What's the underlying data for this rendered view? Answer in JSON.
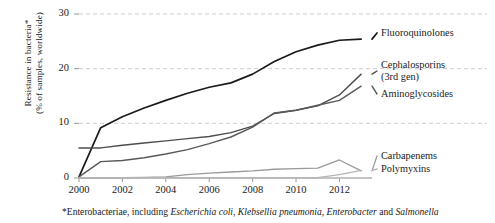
{
  "chart_data": {
    "type": "line",
    "title": "",
    "xlabel": "",
    "ylabel": "Resistance in bacteria*\n(% of samples, worldwide)",
    "ylabel_line1": "Resistance in bacteria*",
    "ylabel_line2": "(% of samples, worldwide)",
    "xlim": [
      2000,
      2013.5
    ],
    "ylim": [
      0,
      30
    ],
    "yticks": [
      0,
      10,
      20,
      30
    ],
    "xticks": [
      2000,
      2002,
      2004,
      2006,
      2008,
      2010,
      2012
    ],
    "xtick_labels": [
      "2000",
      "2002",
      "2004",
      "2006",
      "2008",
      "2010",
      "2012"
    ],
    "ytick_labels": [
      "0",
      "10",
      "20",
      "30"
    ],
    "grid": "horizontal-dashed",
    "legend_position": "right-inline",
    "x": [
      2000,
      2001,
      2002,
      2003,
      2004,
      2005,
      2006,
      2007,
      2008,
      2009,
      2010,
      2011,
      2012,
      2013
    ],
    "series": [
      {
        "name": "Fluoroquinolones",
        "color": "#1a1a1a",
        "width": 1.7,
        "values": [
          0.2,
          9.2,
          11.2,
          12.8,
          14.2,
          15.5,
          16.6,
          17.4,
          19.0,
          21.3,
          23.1,
          24.3,
          25.2,
          25.4
        ],
        "label_x": 2013.8,
        "label_y": 25.4
      },
      {
        "name": "Cephalosporins (3rd gen)",
        "color": "#4d4d4d",
        "width": 1.4,
        "values": [
          5.5,
          5.5,
          6.0,
          6.4,
          6.8,
          7.2,
          7.6,
          8.3,
          9.5,
          11.8,
          12.4,
          13.2,
          15.2,
          19.0
        ],
        "label_line1": "Cephalosporins",
        "label_line2": "(3rd gen)",
        "label_x": 2013.8,
        "label_y": 19.8
      },
      {
        "name": "Aminoglycosides",
        "color": "#595959",
        "width": 1.4,
        "values": [
          0.2,
          3.0,
          3.2,
          3.7,
          4.4,
          5.2,
          6.3,
          7.5,
          9.3,
          11.9,
          12.4,
          13.3,
          14.2,
          16.8
        ],
        "label_x": 2013.8,
        "label_y": 15.6
      },
      {
        "name": "Carbapenems",
        "color": "#9a9a9a",
        "width": 1.3,
        "values": [
          0.05,
          0.05,
          0.05,
          0.1,
          0.2,
          0.6,
          0.9,
          1.1,
          1.3,
          1.6,
          1.7,
          1.8,
          3.3,
          1.3
        ],
        "label_x": 2013.8,
        "label_y": 3.0
      },
      {
        "name": "Polymyxins",
        "color": "#b5b5b5",
        "width": 1.3,
        "values": [
          0.05,
          0.05,
          0.05,
          0.05,
          0.05,
          0.05,
          0.05,
          0.05,
          0.05,
          0.05,
          0.05,
          0.05,
          0.6,
          1.4
        ],
        "label_x": 2013.8,
        "label_y": 0.9
      }
    ],
    "footnote": {
      "prefix": "*Enterobacteriae, including ",
      "italic_1": "Escherichia coli",
      "sep_1": ", ",
      "italic_2": "Klebsellia pneumonia",
      "sep_2": ", ",
      "italic_3": "Enterobacter",
      "sep_3": " and ",
      "italic_4": "Salmonella"
    }
  }
}
